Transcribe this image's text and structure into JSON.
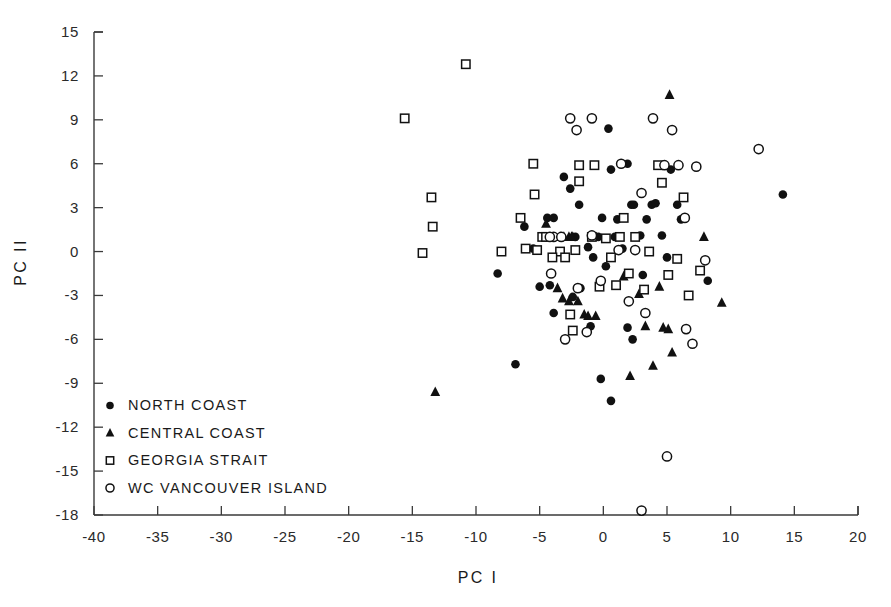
{
  "chart_data": {
    "type": "scatter",
    "title": "",
    "xlabel": "PC I",
    "ylabel": "PC II",
    "xlim": [
      -40,
      20
    ],
    "ylim": [
      -18,
      15
    ],
    "xticks": [
      -40,
      -35,
      -30,
      -25,
      -20,
      -15,
      -10,
      -5,
      0,
      5,
      10,
      15,
      20
    ],
    "xticklabels": [
      "-40",
      "-35",
      "-30",
      "-25",
      "-20",
      "-15",
      "-10",
      "-5",
      "0",
      "5",
      "10",
      "15",
      "20"
    ],
    "yticks": [
      15,
      12,
      9,
      6,
      3,
      0,
      -3,
      -6,
      -9,
      -12,
      -15,
      -18
    ],
    "yticklabels": [
      "15",
      "12",
      "9",
      "6",
      "3",
      "0",
      "-3",
      "-6",
      "-9",
      "-12",
      "-15",
      "-18"
    ],
    "grid": false,
    "legend_position": "lower-left-inside",
    "series": [
      {
        "name": "NORTH COAST",
        "marker": "filled-circle",
        "color": "#111111",
        "points": [
          [
            -8.3,
            -1.5
          ],
          [
            -6.2,
            1.7
          ],
          [
            -5.5,
            0.2
          ],
          [
            -4.4,
            2.3
          ],
          [
            -3.9,
            2.3
          ],
          [
            -3.1,
            5.1
          ],
          [
            -2.6,
            4.3
          ],
          [
            -1.9,
            3.2
          ],
          [
            -1.2,
            0.3
          ],
          [
            -0.8,
            -0.4
          ],
          [
            -0.4,
            1.0
          ],
          [
            -0.1,
            2.3
          ],
          [
            0.4,
            8.4
          ],
          [
            0.6,
            5.6
          ],
          [
            1.1,
            2.2
          ],
          [
            1.5,
            0.2
          ],
          [
            1.9,
            6.0
          ],
          [
            2.2,
            3.2
          ],
          [
            2.4,
            3.2
          ],
          [
            2.9,
            1.1
          ],
          [
            3.4,
            2.2
          ],
          [
            3.8,
            3.2
          ],
          [
            4.1,
            3.3
          ],
          [
            4.6,
            1.1
          ],
          [
            5.0,
            -0.4
          ],
          [
            5.3,
            5.6
          ],
          [
            5.8,
            3.2
          ],
          [
            6.1,
            2.2
          ],
          [
            8.2,
            -2.0
          ],
          [
            14.1,
            3.9
          ],
          [
            -6.9,
            -7.7
          ],
          [
            -3.9,
            -4.2
          ],
          [
            -2.4,
            -3.1
          ],
          [
            -1.0,
            -5.1
          ],
          [
            -0.2,
            -8.7
          ],
          [
            0.6,
            -10.2
          ],
          [
            1.9,
            -5.2
          ],
          [
            2.3,
            -6.0
          ],
          [
            -5.0,
            -2.4
          ],
          [
            -4.2,
            -2.3
          ],
          [
            -1.8,
            -2.5
          ],
          [
            0.2,
            -1.0
          ],
          [
            3.1,
            -1.6
          ],
          [
            0.9,
            1.0
          ],
          [
            -2.2,
            1.0
          ]
        ]
      },
      {
        "name": "CENTRAL COAST",
        "marker": "filled-triangle",
        "color": "#111111",
        "points": [
          [
            -13.2,
            -9.6
          ],
          [
            -4.5,
            1.9
          ],
          [
            -3.4,
            1.0
          ],
          [
            -3.1,
            1.0
          ],
          [
            -2.7,
            1.0
          ],
          [
            -2.4,
            1.0
          ],
          [
            -3.6,
            -2.5
          ],
          [
            -3.2,
            -3.2
          ],
          [
            -2.7,
            -3.4
          ],
          [
            -2.0,
            -3.4
          ],
          [
            -1.5,
            -4.3
          ],
          [
            -1.2,
            -4.4
          ],
          [
            -0.6,
            -4.4
          ],
          [
            1.6,
            -1.7
          ],
          [
            2.8,
            -2.9
          ],
          [
            4.4,
            -2.4
          ],
          [
            3.3,
            -5.1
          ],
          [
            4.7,
            -5.2
          ],
          [
            5.1,
            -5.3
          ],
          [
            5.4,
            -6.9
          ],
          [
            5.2,
            10.7
          ],
          [
            7.9,
            1.0
          ],
          [
            9.3,
            -3.5
          ],
          [
            3.9,
            -7.8
          ],
          [
            2.1,
            -8.5
          ],
          [
            -2.5,
            1.0
          ]
        ]
      },
      {
        "name": "GEORGIA STRAIT",
        "marker": "open-square",
        "color": "#111111",
        "points": [
          [
            -15.6,
            9.1
          ],
          [
            -10.8,
            12.8
          ],
          [
            -13.5,
            3.7
          ],
          [
            -13.4,
            1.7
          ],
          [
            -14.2,
            -0.1
          ],
          [
            -8.0,
            0.0
          ],
          [
            -6.5,
            2.3
          ],
          [
            -6.1,
            0.2
          ],
          [
            -5.4,
            3.9
          ],
          [
            -5.2,
            0.1
          ],
          [
            -4.8,
            1.0
          ],
          [
            -4.5,
            1.0
          ],
          [
            -3.4,
            0.0
          ],
          [
            -2.2,
            0.1
          ],
          [
            -1.9,
            5.9
          ],
          [
            -1.9,
            4.8
          ],
          [
            -0.7,
            5.9
          ],
          [
            0.2,
            0.9
          ],
          [
            0.6,
            -0.4
          ],
          [
            1.0,
            -2.3
          ],
          [
            1.6,
            2.3
          ],
          [
            2.0,
            -1.5
          ],
          [
            2.5,
            1.0
          ],
          [
            3.2,
            -2.6
          ],
          [
            3.6,
            0.0
          ],
          [
            4.3,
            5.9
          ],
          [
            4.6,
            4.7
          ],
          [
            5.1,
            -1.6
          ],
          [
            5.8,
            -0.5
          ],
          [
            6.3,
            3.7
          ],
          [
            6.7,
            -3.0
          ],
          [
            7.6,
            -1.3
          ],
          [
            -2.6,
            -4.3
          ],
          [
            -2.4,
            -5.4
          ],
          [
            -0.3,
            -2.4
          ],
          [
            -5.5,
            6.0
          ],
          [
            -0.9,
            1.0
          ],
          [
            1.3,
            1.0
          ],
          [
            -4.0,
            -0.4
          ],
          [
            -3.0,
            -0.4
          ]
        ]
      },
      {
        "name": "WC VANCOUVER ISLAND",
        "marker": "open-circle",
        "color": "#111111",
        "points": [
          [
            -2.6,
            9.1
          ],
          [
            -0.9,
            9.1
          ],
          [
            -2.1,
            8.3
          ],
          [
            3.9,
            9.1
          ],
          [
            5.4,
            8.3
          ],
          [
            1.4,
            6.0
          ],
          [
            4.8,
            5.9
          ],
          [
            5.9,
            5.9
          ],
          [
            7.3,
            5.8
          ],
          [
            3.0,
            4.0
          ],
          [
            6.4,
            2.3
          ],
          [
            12.2,
            7.0
          ],
          [
            -3.9,
            1.0
          ],
          [
            -3.3,
            1.0
          ],
          [
            -0.9,
            1.1
          ],
          [
            1.2,
            0.1
          ],
          [
            2.5,
            0.1
          ],
          [
            -4.1,
            -1.5
          ],
          [
            -2.0,
            -2.5
          ],
          [
            -0.2,
            -2.0
          ],
          [
            2.0,
            -3.4
          ],
          [
            3.3,
            -4.2
          ],
          [
            6.5,
            -5.3
          ],
          [
            7.0,
            -6.3
          ],
          [
            5.0,
            -14.0
          ],
          [
            3.0,
            -17.7
          ],
          [
            -1.3,
            -5.5
          ],
          [
            -3.0,
            -6.0
          ],
          [
            -4.2,
            1.0
          ],
          [
            8.0,
            -0.6
          ]
        ]
      }
    ]
  },
  "legend": {
    "items": [
      {
        "marker": "filled-circle",
        "label": "NORTH  COAST"
      },
      {
        "marker": "filled-triangle",
        "label": "CENTRAL  COAST"
      },
      {
        "marker": "open-square",
        "label": "GEORGIA  STRAIT"
      },
      {
        "marker": "open-circle",
        "label": "WC  VANCOUVER  ISLAND"
      }
    ]
  },
  "colors": {
    "ink": "#111111",
    "axis": "#3a3a3a",
    "background": "#ffffff"
  }
}
